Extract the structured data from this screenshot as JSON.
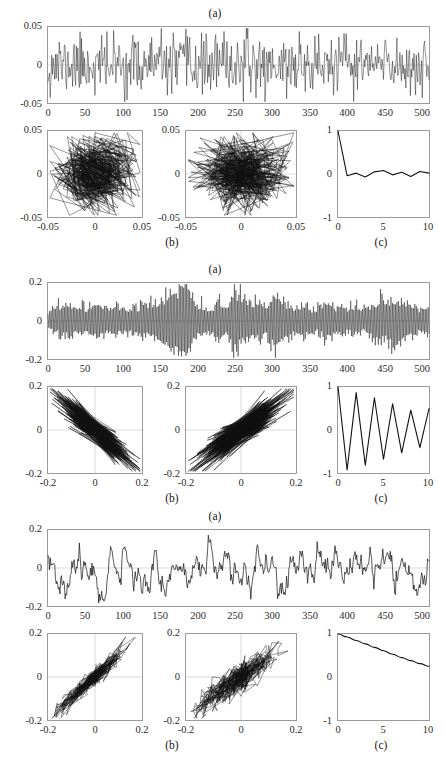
{
  "figure": {
    "title": "",
    "blocks": [
      {
        "id": "block-1",
        "label_a": "(a)",
        "label_b": "(b)",
        "label_c": "(c)",
        "timeseries": {
          "yticks": [
            "0.05",
            "0",
            "-0.05"
          ],
          "xticks": [
            "0",
            "50",
            "100",
            "150",
            "200",
            "250",
            "300",
            "350",
            "400",
            "450",
            "500"
          ],
          "ylim": [
            -0.05,
            0.05
          ],
          "xlim": [
            0,
            512
          ]
        },
        "phase1": {
          "yticks": [
            "0.05",
            "0",
            "-0.05"
          ],
          "xticks": [
            "-0.05",
            "0",
            "0.05"
          ],
          "lim": [
            -0.05,
            0.05
          ]
        },
        "phase2": {
          "yticks": [
            "0.05",
            "0",
            "-0.05"
          ],
          "xticks": [
            "-0.05",
            "0",
            "0.05"
          ],
          "lim": [
            -0.05,
            0.05
          ]
        },
        "acf": {
          "yticks": [
            "1",
            "0",
            "-1"
          ],
          "xticks": [
            "0",
            "5",
            "10"
          ],
          "ylim": [
            -1,
            1
          ],
          "xlim": [
            0,
            10
          ]
        }
      },
      {
        "id": "block-2",
        "label_a": "(a)",
        "label_b": "(b)",
        "label_c": "(c)",
        "timeseries": {
          "yticks": [
            "0.2",
            "0",
            "-0.2"
          ],
          "xticks": [
            "0",
            "50",
            "100",
            "150",
            "200",
            "250",
            "300",
            "350",
            "400",
            "450",
            "500"
          ],
          "ylim": [
            -0.2,
            0.2
          ],
          "xlim": [
            0,
            512
          ]
        },
        "phase1": {
          "yticks": [
            "0.2",
            "0",
            "-0.2"
          ],
          "xticks": [
            "-0.2",
            "0",
            "0.2"
          ],
          "lim": [
            -0.2,
            0.2
          ]
        },
        "phase2": {
          "yticks": [
            "0.2",
            "0",
            "-0.2"
          ],
          "xticks": [
            "-0.2",
            "0",
            "0.2"
          ],
          "lim": [
            -0.2,
            0.2
          ]
        },
        "acf": {
          "yticks": [
            "1",
            "0",
            "-1"
          ],
          "xticks": [
            "0",
            "5",
            "10"
          ],
          "ylim": [
            -1,
            1
          ],
          "xlim": [
            0,
            10
          ]
        }
      },
      {
        "id": "block-3",
        "label_a": "(a)",
        "label_b": "(b)",
        "label_c": "(c)",
        "timeseries": {
          "yticks": [
            "0.2",
            "0",
            "-0.2"
          ],
          "xticks": [
            "0",
            "50",
            "100",
            "150",
            "200",
            "250",
            "300",
            "350",
            "400",
            "450",
            "500"
          ],
          "ylim": [
            -0.2,
            0.2
          ],
          "xlim": [
            0,
            512
          ]
        },
        "phase1": {
          "yticks": [
            "0.2",
            "0",
            "-0.2"
          ],
          "xticks": [
            "-0.2",
            "0",
            "0.2"
          ],
          "lim": [
            -0.2,
            0.2
          ]
        },
        "phase2": {
          "yticks": [
            "0.2",
            "0",
            "-0.2"
          ],
          "xticks": [
            "-0.2",
            "0",
            "0.2"
          ],
          "lim": [
            -0.2,
            0.2
          ]
        },
        "acf": {
          "yticks": [
            "1",
            "0",
            "-1"
          ],
          "xticks": [
            "0",
            "5",
            "10"
          ],
          "ylim": [
            -1,
            1
          ],
          "xlim": [
            0,
            10
          ]
        }
      }
    ]
  },
  "chart_data": [
    {
      "id": "block1-timeseries",
      "type": "line",
      "title": "(a)",
      "xlabel": "",
      "ylabel": "",
      "xlim": [
        0,
        512
      ],
      "ylim": [
        -0.05,
        0.05
      ],
      "xticks": [
        0,
        50,
        100,
        150,
        200,
        250,
        300,
        350,
        400,
        450,
        500
      ],
      "yticks": [
        -0.05,
        0,
        0.05
      ],
      "grid": false,
      "description": "White-noise-like broadband signal, amplitude filling +/-0.05 band, 512 samples",
      "series": [
        {
          "name": "x(t)",
          "kind": "white-noise",
          "n": 512,
          "amplitude": 0.045,
          "seed": 11
        }
      ]
    },
    {
      "id": "block1-phase1",
      "type": "scatter",
      "title": "(b) left",
      "xlabel": "",
      "ylabel": "",
      "xlim": [
        -0.05,
        0.05
      ],
      "ylim": [
        -0.05,
        0.05
      ],
      "xticks": [
        -0.05,
        0,
        0.05
      ],
      "yticks": [
        -0.05,
        0,
        0.05
      ],
      "grid": true,
      "description": "Delay embedding x(t) vs x(t+1); isotropic filled square cloud indicating no correlation",
      "series": [
        {
          "name": "x(t+1) vs x(t)",
          "kind": "white-noise-delay",
          "lag": 1,
          "n": 512,
          "amplitude": 0.045,
          "seed": 11
        }
      ]
    },
    {
      "id": "block1-phase2",
      "type": "scatter",
      "title": "(b) right",
      "xlabel": "",
      "ylabel": "",
      "xlim": [
        -0.05,
        0.05
      ],
      "ylim": [
        -0.05,
        0.05
      ],
      "xticks": [
        -0.05,
        0,
        0.05
      ],
      "yticks": [
        -0.05,
        0,
        0.05
      ],
      "grid": true,
      "description": "Delay embedding x(t) vs x(t+2); isotropic filled square cloud",
      "series": [
        {
          "name": "x(t+2) vs x(t)",
          "kind": "white-noise-delay",
          "lag": 2,
          "n": 512,
          "amplitude": 0.045,
          "seed": 11
        }
      ]
    },
    {
      "id": "block1-acf",
      "type": "line",
      "title": "(c)",
      "xlabel": "",
      "ylabel": "",
      "xlim": [
        0,
        10
      ],
      "ylim": [
        -1,
        1
      ],
      "xticks": [
        0,
        5,
        10
      ],
      "yticks": [
        -1,
        0,
        1
      ],
      "grid": false,
      "description": "Autocorrelation drops immediately from 1 to near 0 and stays flat (white noise)",
      "x": [
        0,
        1,
        2,
        3,
        4,
        5,
        6,
        7,
        8,
        9,
        10
      ],
      "values": [
        1.0,
        -0.04,
        0.02,
        -0.07,
        0.05,
        0.08,
        -0.02,
        0.04,
        -0.06,
        0.06,
        0.02
      ]
    },
    {
      "id": "block2-timeseries",
      "type": "line",
      "title": "(a)",
      "xlabel": "",
      "ylabel": "",
      "xlim": [
        0,
        512
      ],
      "ylim": [
        -0.2,
        0.2
      ],
      "xticks": [
        0,
        50,
        100,
        150,
        200,
        250,
        300,
        350,
        400,
        450,
        500
      ],
      "yticks": [
        -0.2,
        0,
        0.2
      ],
      "grid": false,
      "description": "High-frequency near-Nyquist oscillation with strong amplitude modulation (bursts); largest burst near sample 175 reaching +/-0.2",
      "series": [
        {
          "name": "x(t)",
          "kind": "modulated-nyquist",
          "n": 512,
          "amplitude": 0.2,
          "seed": 23
        }
      ]
    },
    {
      "id": "block2-phase1",
      "type": "scatter",
      "title": "(b) left",
      "xlabel": "",
      "ylabel": "",
      "xlim": [
        -0.2,
        0.2
      ],
      "ylim": [
        -0.2,
        0.2
      ],
      "xticks": [
        -0.2,
        0,
        0.2
      ],
      "yticks": [
        -0.2,
        0,
        0.2
      ],
      "grid": true,
      "description": "Delay-1 embedding collapses to a narrow anti-diagonal band (negative lag-1 correlation approx -0.93)",
      "series": [
        {
          "name": "x(t+1) vs x(t)",
          "kind": "antidiagonal-band",
          "lag": 1,
          "correlation": -0.93,
          "n": 512,
          "amplitude": 0.2,
          "seed": 23
        }
      ]
    },
    {
      "id": "block2-phase2",
      "type": "scatter",
      "title": "(b) right",
      "xlabel": "",
      "ylabel": "",
      "xlim": [
        -0.2,
        0.2
      ],
      "ylim": [
        -0.2,
        0.2
      ],
      "xticks": [
        -0.2,
        0,
        0.2
      ],
      "yticks": [
        -0.2,
        0,
        0.2
      ],
      "grid": true,
      "description": "Delay-2 embedding forms a positive diagonal band (lag-2 correlation approx +0.88)",
      "series": [
        {
          "name": "x(t+2) vs x(t)",
          "kind": "diagonal-band",
          "lag": 2,
          "correlation": 0.88,
          "n": 512,
          "amplitude": 0.2,
          "seed": 23
        }
      ]
    },
    {
      "id": "block2-acf",
      "type": "line",
      "title": "(c)",
      "xlabel": "",
      "ylabel": "",
      "xlim": [
        0,
        10
      ],
      "ylim": [
        -1,
        1
      ],
      "xticks": [
        0,
        5,
        10
      ],
      "yticks": [
        -1,
        0,
        1
      ],
      "grid": false,
      "description": "Alternating-sign slowly decaying autocorrelation (period-2 oscillation)",
      "x": [
        0,
        1,
        2,
        3,
        4,
        5,
        6,
        7,
        8,
        9,
        10
      ],
      "values": [
        1.0,
        -0.93,
        0.87,
        -0.82,
        0.75,
        -0.68,
        0.61,
        -0.53,
        0.46,
        -0.41,
        0.5
      ]
    },
    {
      "id": "block3-timeseries",
      "type": "line",
      "title": "(a)",
      "xlabel": "",
      "ylabel": "",
      "xlim": [
        0,
        512
      ],
      "ylim": [
        -0.2,
        0.2
      ],
      "xticks": [
        0,
        50,
        100,
        150,
        200,
        250,
        300,
        350,
        400,
        450,
        500
      ],
      "yticks": [
        -0.2,
        0,
        0.2
      ],
      "grid": false,
      "description": "Smooth low-frequency correlated (red noise) signal wandering between -0.19 and +0.17",
      "series": [
        {
          "name": "x(t)",
          "kind": "red-noise",
          "n": 512,
          "amplitude": 0.18,
          "seed": 37
        }
      ]
    },
    {
      "id": "block3-phase1",
      "type": "scatter",
      "title": "(b) left",
      "xlabel": "",
      "ylabel": "",
      "xlim": [
        -0.2,
        0.2
      ],
      "ylim": [
        -0.2,
        0.2
      ],
      "xticks": [
        -0.2,
        0,
        0.2
      ],
      "yticks": [
        -0.2,
        0,
        0.2
      ],
      "grid": true,
      "description": "Delay-1 embedding is a tight positive diagonal band (lag-1 correlation approx 0.97)",
      "series": [
        {
          "name": "x(t+1) vs x(t)",
          "kind": "diagonal-band",
          "lag": 1,
          "correlation": 0.97,
          "n": 512,
          "amplitude": 0.18,
          "seed": 37
        }
      ]
    },
    {
      "id": "block3-phase2",
      "type": "scatter",
      "title": "(b) right",
      "xlabel": "",
      "ylabel": "",
      "xlim": [
        -0.2,
        0.2
      ],
      "ylim": [
        -0.2,
        0.2
      ],
      "xticks": [
        -0.2,
        0,
        0.2
      ],
      "yticks": [
        -0.2,
        0,
        0.2
      ],
      "grid": true,
      "description": "Delay-2 embedding is a wider positive diagonal band (lag-2 correlation approx 0.9)",
      "series": [
        {
          "name": "x(t+2) vs x(t)",
          "kind": "diagonal-band",
          "lag": 2,
          "correlation": 0.9,
          "n": 512,
          "amplitude": 0.18,
          "seed": 37
        }
      ]
    },
    {
      "id": "block3-acf",
      "type": "line",
      "title": "(c)",
      "xlabel": "",
      "ylabel": "",
      "xlim": [
        0,
        10
      ],
      "ylim": [
        -1,
        1
      ],
      "xticks": [
        0,
        5,
        10
      ],
      "yticks": [
        -1,
        0,
        1
      ],
      "grid": false,
      "description": "Smooth monotonic exponential decay from 1 to about 0.25 over 10 lags",
      "x": [
        0,
        1,
        2,
        3,
        4,
        5,
        6,
        7,
        8,
        9,
        10
      ],
      "values": [
        1.0,
        0.93,
        0.85,
        0.77,
        0.69,
        0.61,
        0.53,
        0.45,
        0.38,
        0.31,
        0.25
      ]
    }
  ]
}
